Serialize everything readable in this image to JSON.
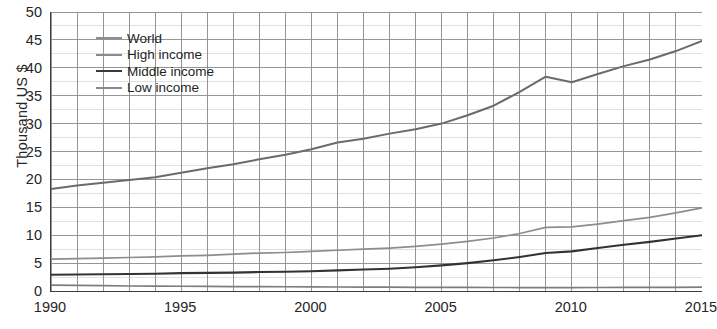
{
  "chart_data": {
    "type": "line",
    "title": "",
    "subtitle": "",
    "xlabel": "",
    "ylabel": "Thousand US $",
    "xlim": [
      1990,
      2015
    ],
    "ylim": [
      0,
      50
    ],
    "y_ticks": [
      0,
      5,
      10,
      15,
      20,
      25,
      30,
      35,
      40,
      45,
      50
    ],
    "x_ticks": [
      1990,
      1995,
      2000,
      2005,
      2010,
      2015
    ],
    "x_tick_labels": [
      "1990",
      "1995",
      "2000",
      "2005",
      "2010",
      "2015"
    ],
    "y_tick_labels": [
      "0",
      "5",
      "10",
      "15",
      "20",
      "25",
      "30",
      "35",
      "40",
      "45",
      "50"
    ],
    "x_minor_step": 1,
    "y_minor_step": 2.5,
    "grid": true,
    "grid_color": "#8a8a8a",
    "legend_position": "top-left",
    "x": [
      1990,
      1991,
      1992,
      1993,
      1994,
      1995,
      1996,
      1997,
      1998,
      1999,
      2000,
      2001,
      2002,
      2003,
      2004,
      2005,
      2006,
      2007,
      2008,
      2009,
      2010,
      2011,
      2012,
      2013,
      2014,
      2015
    ],
    "series": [
      {
        "name": "High income",
        "color": "#6b6b6b",
        "width": 2.0,
        "values": [
          18.3,
          18.9,
          19.4,
          19.9,
          20.4,
          21.2,
          22.0,
          22.7,
          23.6,
          24.4,
          25.4,
          26.6,
          27.3,
          28.2,
          29.0,
          30.0,
          31.5,
          33.2,
          35.7,
          38.4,
          37.4,
          38.9,
          40.3,
          41.5,
          43.0,
          44.8
        ]
      },
      {
        "name": "World",
        "color": "#8d8d8d",
        "width": 1.7,
        "values": [
          5.7,
          5.8,
          5.9,
          6.0,
          6.1,
          6.3,
          6.4,
          6.6,
          6.8,
          6.9,
          7.1,
          7.3,
          7.5,
          7.7,
          8.0,
          8.4,
          8.9,
          9.5,
          10.3,
          11.4,
          11.5,
          12.0,
          12.6,
          13.2,
          14.0,
          14.9
        ]
      },
      {
        "name": "Middle income",
        "color": "#333333",
        "width": 2.1,
        "values": [
          2.9,
          2.95,
          3.0,
          3.05,
          3.1,
          3.2,
          3.25,
          3.3,
          3.4,
          3.45,
          3.55,
          3.7,
          3.85,
          4.0,
          4.25,
          4.6,
          5.0,
          5.5,
          6.1,
          6.8,
          7.1,
          7.7,
          8.3,
          8.8,
          9.4,
          10.0
        ]
      },
      {
        "name": "Low income",
        "color": "#7d7d7d",
        "width": 1.7,
        "values": [
          1.05,
          1.0,
          0.95,
          0.9,
          0.88,
          0.85,
          0.82,
          0.8,
          0.78,
          0.76,
          0.74,
          0.72,
          0.7,
          0.68,
          0.66,
          0.65,
          0.64,
          0.63,
          0.62,
          0.62,
          0.62,
          0.63,
          0.64,
          0.65,
          0.66,
          0.68
        ]
      }
    ],
    "legend": [
      {
        "label": "World",
        "color": "#8d8d8d",
        "width": 2.6
      },
      {
        "label": "High income",
        "color": "#8a8a8a",
        "width": 2.2
      },
      {
        "label": "Middle income",
        "color": "#3a3a3a",
        "width": 2.8
      },
      {
        "label": "Low income",
        "color": "#8a8a8a",
        "width": 2.2
      }
    ]
  },
  "axis_color": "#3d3d3d"
}
